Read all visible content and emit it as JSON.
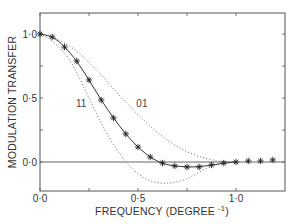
{
  "chart_data": {
    "type": "line",
    "title": "",
    "xlabel": "FREQUENCY (DEGREE",
    "xlabel_sup": "-1",
    "xlabel_close": ")",
    "ylabel": "MODULATION TRANSFER",
    "xlim": [
      0.0,
      1.25
    ],
    "ylim": [
      -0.23,
      1.15
    ],
    "grid": false,
    "x_ticks": [
      0.0,
      0.25,
      0.5,
      0.75,
      1.0
    ],
    "x_tick_labels": [
      "0·0",
      "",
      "0·5",
      "",
      "1·0"
    ],
    "y_ticks": [
      0.0,
      0.25,
      0.5,
      0.75,
      1.0
    ],
    "y_tick_labels": [
      "0·0",
      "",
      "0·5",
      "",
      "1·0"
    ],
    "zero_line": true,
    "series": [
      {
        "name": "measured",
        "style": "stars",
        "x": [
          0.0,
          0.0625,
          0.125,
          0.1875,
          0.25,
          0.3125,
          0.375,
          0.4375,
          0.5,
          0.5625,
          0.625,
          0.6875,
          0.75,
          0.8125,
          0.875,
          0.9375,
          1.0,
          1.0625,
          1.125,
          1.1875
        ],
        "y": [
          1.0,
          0.977,
          0.898,
          0.789,
          0.641,
          0.484,
          0.344,
          0.219,
          0.117,
          0.039,
          -0.008,
          -0.031,
          -0.039,
          -0.039,
          -0.023,
          -0.008,
          0.0,
          0.008,
          0.008,
          0.016
        ]
      },
      {
        "name": "fit",
        "style": "solid",
        "x": [
          0.0,
          0.0625,
          0.125,
          0.1875,
          0.25,
          0.3125,
          0.375,
          0.4375,
          0.5,
          0.5625,
          0.625,
          0.6875,
          0.75,
          0.8125,
          0.875,
          0.9375,
          1.0
        ],
        "y": [
          1.0,
          0.975,
          0.9,
          0.785,
          0.64,
          0.485,
          0.345,
          0.22,
          0.118,
          0.04,
          -0.01,
          -0.03,
          -0.038,
          -0.036,
          -0.024,
          -0.01,
          0.0
        ]
      },
      {
        "name": "01",
        "style": "dotted",
        "x": [
          0.0,
          0.1,
          0.2,
          0.3,
          0.4,
          0.5,
          0.6,
          0.7,
          0.8,
          0.9,
          0.97
        ],
        "y": [
          1.0,
          0.95,
          0.85,
          0.7,
          0.53,
          0.37,
          0.23,
          0.12,
          0.05,
          0.01,
          0.0
        ]
      },
      {
        "name": "11",
        "style": "dotted",
        "x": [
          0.0,
          0.05,
          0.1,
          0.15,
          0.2,
          0.25,
          0.3,
          0.35,
          0.4,
          0.45,
          0.5,
          0.55,
          0.6,
          0.65,
          0.7,
          0.75,
          0.8,
          0.85,
          0.9,
          0.97
        ],
        "y": [
          1.0,
          0.96,
          0.89,
          0.8,
          0.66,
          0.5,
          0.34,
          0.2,
          0.08,
          -0.02,
          -0.09,
          -0.14,
          -0.16,
          -0.165,
          -0.155,
          -0.13,
          -0.09,
          -0.05,
          -0.02,
          0.0
        ]
      }
    ],
    "annotations": [
      {
        "text": "11",
        "x": 0.21,
        "y": 0.43
      },
      {
        "text": "01",
        "x": 0.52,
        "y": 0.43
      }
    ]
  }
}
